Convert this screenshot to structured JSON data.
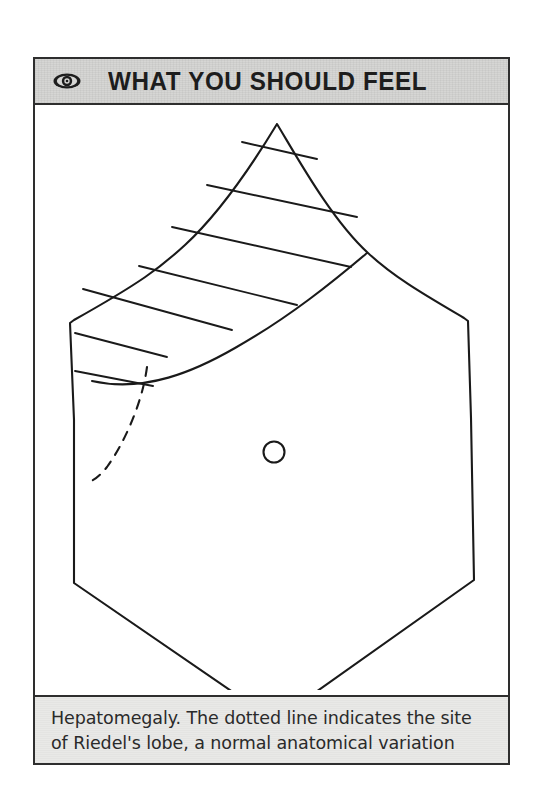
{
  "figure": {
    "header": {
      "icon": "eye-icon",
      "title": "WHAT YOU SHOULD FEEL"
    },
    "caption": "Hepatomegaly. The dotted line indicates the site of Riedel's lobe, a normal anatomical variation",
    "colors": {
      "page_background": "#ffffff",
      "frame_border": "#2e2e2e",
      "header_band": "#d6d6d4",
      "caption_band": "#e9e9e7",
      "ink": "#1d1d1d",
      "line_art": "#1a1a1a"
    }
  },
  "diagram": {
    "type": "line-art-anatomical-illustration",
    "parts": [
      {
        "name": "torso-outline",
        "description": "hexagonal outline of the anterior abdominal wall with costal margins above and inguinal/pubic outline below",
        "stroke": "#1a1a1a",
        "style": "solid"
      },
      {
        "name": "liver-outline",
        "description": "enlarged liver shaded with diagonal hatching, extending from right costal margin down past the umbilical level",
        "stroke": "#1a1a1a",
        "style": "solid"
      },
      {
        "name": "liver-hatching",
        "description": "seven parallel diagonal hatch lines filling the liver area",
        "line_count": 7,
        "stroke": "#1a1a1a"
      },
      {
        "name": "riedels-lobe-dashed-line",
        "description": "dashed curve marking the site of Riedel's lobe, a normal anatomical variation",
        "stroke": "#1a1a1a",
        "style": "dashed"
      },
      {
        "name": "umbilicus-marker",
        "description": "small open circle marking the umbilicus",
        "stroke": "#1a1a1a",
        "style": "solid"
      }
    ]
  }
}
